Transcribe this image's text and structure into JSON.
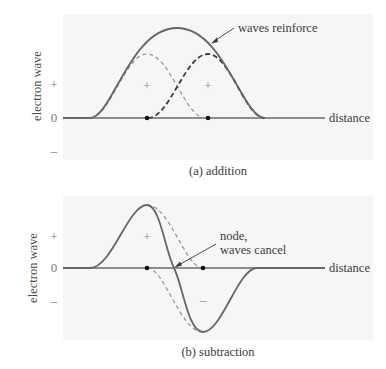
{
  "figure": {
    "panels": [
      {
        "id": "a",
        "caption": "(a) addition",
        "y_axis_label": "electron wave",
        "x_axis_label": "distance",
        "y_ticks": [
          "+",
          "0",
          "–"
        ],
        "region_signs": [
          "+",
          "+"
        ],
        "annotation": "waves reinforce",
        "curves": [
          {
            "name": "wave-1",
            "style": "light-dashed",
            "shape": "positive hump centered on left nucleus"
          },
          {
            "name": "wave-2",
            "style": "dark-dashed",
            "shape": "positive hump centered on right nucleus"
          },
          {
            "name": "sum",
            "style": "solid",
            "shape": "broad positive hump (constructive interference)"
          }
        ],
        "nuclei_dots": 2
      },
      {
        "id": "b",
        "caption": "(b) subtraction",
        "y_axis_label": "electron wave",
        "x_axis_label": "distance",
        "y_ticks": [
          "+",
          "0",
          "–"
        ],
        "region_signs": [
          "+",
          "–"
        ],
        "annotation_line1": "node,",
        "annotation_line2": "waves cancel",
        "curves": [
          {
            "name": "wave-1",
            "style": "dashed",
            "shape": "positive lobe"
          },
          {
            "name": "wave-2",
            "style": "dashed",
            "shape": "negative lobe"
          },
          {
            "name": "difference",
            "style": "solid",
            "shape": "positive lobe, node, negative lobe"
          }
        ],
        "nuclei_dots": 2
      }
    ]
  }
}
